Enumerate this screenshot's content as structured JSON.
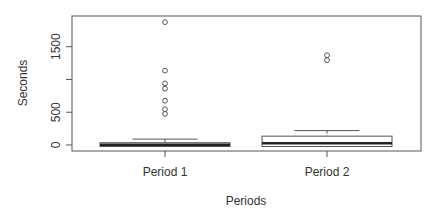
{
  "chart_data": {
    "type": "boxplot",
    "title": "",
    "xlabel": "Periods",
    "ylabel": "Seconds",
    "categories": [
      "Period 1",
      "Period 2"
    ],
    "yticks": [
      0,
      500,
      1000,
      1500
    ],
    "ytick_labels": [
      "0",
      "500",
      "",
      "1500"
    ],
    "ylim": [
      -25,
      2000
    ],
    "grid": false,
    "legend": null,
    "series": [
      {
        "name": "Period 1",
        "whisker_low": 0,
        "q1": 0,
        "median": 5,
        "q3": 35,
        "whisker_high": 90,
        "outliers": [
          1875,
          1135,
          940,
          860,
          675,
          545,
          475
        ]
      },
      {
        "name": "Period 2",
        "whisker_low": 0,
        "q1": 0,
        "median": 25,
        "q3": 135,
        "whisker_high": 220,
        "outliers": [
          1370,
          1295
        ]
      }
    ]
  },
  "axes": {
    "x_title": "Periods",
    "y_title": "Seconds"
  }
}
